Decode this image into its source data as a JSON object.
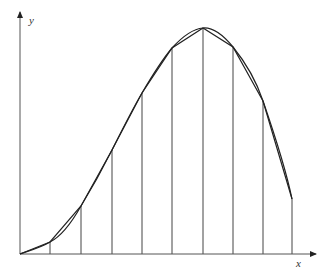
{
  "diagram": {
    "type": "trapezoidal-rule-approximation",
    "axes": {
      "x_label": "x",
      "y_label": "y",
      "origin": [
        20,
        254
      ],
      "x_axis_end": 316,
      "y_axis_top": 12
    },
    "partition_x": [
      20,
      50,
      81,
      112,
      142,
      172,
      203,
      233,
      263,
      292
    ],
    "polyline_y": [
      254,
      242,
      206,
      150,
      93,
      48,
      28,
      47,
      101,
      199
    ],
    "curve_path": "M20,254 C32,250 42,247 50,242 C62,236 72,222 81,206 C92,188 102,170 112,150 C122,130 132,110 142,93 C152,76 162,60 172,48 C182,37 192,29 203,28 C214,27 224,36 233,47 C246,63 256,80 263,101 C273,130 285,165 292,199",
    "colors": {
      "line": "#222222",
      "axis": "#555555",
      "background": "#ffffff"
    }
  }
}
